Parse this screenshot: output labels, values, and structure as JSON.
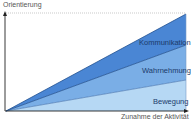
{
  "diagram": {
    "y_axis_label": "Orientierung",
    "x_axis_label": "Zunahme der Aktivität",
    "bands": [
      {
        "label": "Kommunikation",
        "color": "#4a86d4"
      },
      {
        "label": "Wahrnehmung",
        "color": "#7aaee6"
      },
      {
        "label": "Bewegung",
        "color": "#b6d8f4"
      }
    ],
    "colors": {
      "axis": "#222222",
      "edge": "#1f4f8f",
      "dotted": "#bbbbbb"
    }
  }
}
